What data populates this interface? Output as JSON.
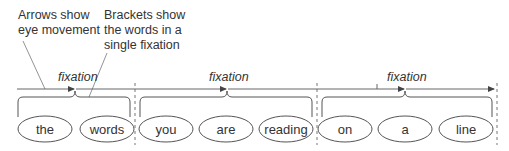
{
  "annotations": {
    "arrows": {
      "lines": [
        "Arrows show",
        "eye movement"
      ]
    },
    "brackets": {
      "lines": [
        "Brackets show",
        "the words in a",
        "single fixation"
      ]
    }
  },
  "fixation_label": "fixation",
  "groups": [
    {
      "fixation": "fixation",
      "words": [
        "the",
        "words"
      ]
    },
    {
      "fixation": "fixation",
      "words": [
        "you",
        "are",
        "reading"
      ]
    },
    {
      "fixation": "fixation",
      "words": [
        "on",
        "a",
        "line"
      ]
    }
  ],
  "colors": {
    "stroke": "#555555",
    "text": "#333333",
    "background": "#ffffff"
  }
}
